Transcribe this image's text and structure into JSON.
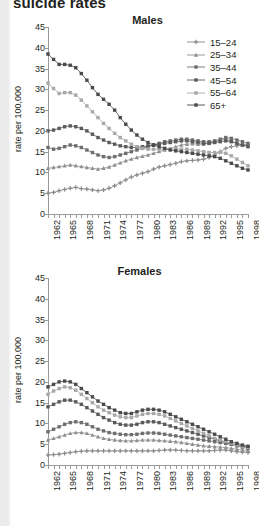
{
  "page": {
    "title": "suicide rates"
  },
  "axis": {
    "ylabel": "rate per 100,000",
    "yticks": [
      0,
      5,
      10,
      15,
      20,
      25,
      30,
      35,
      40,
      45
    ],
    "xlabels": [
      "1962",
      "1965",
      "1968",
      "1971",
      "1974",
      "1977",
      "1980",
      "1983",
      "1986",
      "1989",
      "1992",
      "1995",
      "1998"
    ]
  },
  "legend": {
    "items": [
      {
        "label": "15–24",
        "color": "#8a8a8a",
        "marker": "plus"
      },
      {
        "label": "25–34",
        "color": "#8f8f8f",
        "marker": "triangle"
      },
      {
        "label": "35–44",
        "color": "#6e6e6e",
        "marker": "square"
      },
      {
        "label": "45–54",
        "color": "#5a5a5a",
        "marker": "square"
      },
      {
        "label": "55–64",
        "color": "#a8a8a8",
        "marker": "square"
      },
      {
        "label": "65+",
        "color": "#4a4a4a",
        "marker": "square"
      }
    ]
  },
  "chart_data": [
    {
      "type": "line",
      "title": "Males",
      "xlabel": "",
      "ylabel": "rate per 100,000",
      "ylim": [
        0,
        45
      ],
      "grid": false,
      "legend_position": "top-right",
      "x": [
        1962,
        1963,
        1964,
        1965,
        1966,
        1967,
        1968,
        1969,
        1970,
        1971,
        1972,
        1973,
        1974,
        1975,
        1976,
        1977,
        1978,
        1979,
        1980,
        1981,
        1982,
        1983,
        1984,
        1985,
        1986,
        1987,
        1988,
        1989,
        1990,
        1991,
        1992,
        1993,
        1994,
        1995,
        1996,
        1997,
        1998
      ],
      "series": [
        {
          "name": "15–24",
          "color": "#8a8a8a",
          "values": [
            5.0,
            5.2,
            5.6,
            5.9,
            6.2,
            6.4,
            6.1,
            6.0,
            5.8,
            5.6,
            5.8,
            6.2,
            6.8,
            7.5,
            8.2,
            8.9,
            9.4,
            9.8,
            10.2,
            10.8,
            11.3,
            11.6,
            11.9,
            12.2,
            12.6,
            12.8,
            12.9,
            13.0,
            13.2,
            13.6,
            14.2,
            15.0,
            15.8,
            16.2,
            16.4,
            16.6,
            16.8
          ]
        },
        {
          "name": "25–34",
          "color": "#8f8f8f",
          "values": [
            11.0,
            11.2,
            11.4,
            11.6,
            11.8,
            11.6,
            11.4,
            11.2,
            11.0,
            10.8,
            11.0,
            11.3,
            11.8,
            12.3,
            12.8,
            13.2,
            13.6,
            13.9,
            14.2,
            14.6,
            15.0,
            15.4,
            15.8,
            16.2,
            16.6,
            16.8,
            16.9,
            16.8,
            16.8,
            17.0,
            17.4,
            17.8,
            18.0,
            17.6,
            17.0,
            16.6,
            16.4
          ]
        },
        {
          "name": "35–44",
          "color": "#6e6e6e",
          "values": [
            16.0,
            15.6,
            15.8,
            16.2,
            16.6,
            16.4,
            16.0,
            15.4,
            14.8,
            14.2,
            13.8,
            13.6,
            13.8,
            14.2,
            14.6,
            15.0,
            15.4,
            15.8,
            16.2,
            16.6,
            17.0,
            17.4,
            17.6,
            17.8,
            18.0,
            18.0,
            17.8,
            17.6,
            17.4,
            17.4,
            17.6,
            18.0,
            18.4,
            18.2,
            17.8,
            17.4,
            17.0
          ]
        },
        {
          "name": "45–54",
          "color": "#5a5a5a",
          "values": [
            20.0,
            20.2,
            20.6,
            21.0,
            21.2,
            21.0,
            20.6,
            20.0,
            19.2,
            18.4,
            17.8,
            17.2,
            16.8,
            16.4,
            16.2,
            16.0,
            16.0,
            16.2,
            16.4,
            16.6,
            16.8,
            17.0,
            17.2,
            17.4,
            17.6,
            17.6,
            17.4,
            17.2,
            17.0,
            17.0,
            17.2,
            17.4,
            17.6,
            17.4,
            17.0,
            16.6,
            16.2
          ]
        },
        {
          "name": "55–64",
          "color": "#a8a8a8",
          "values": [
            31.5,
            30.2,
            29.0,
            29.2,
            29.2,
            28.6,
            27.4,
            26.0,
            24.6,
            23.2,
            21.8,
            20.6,
            19.4,
            18.4,
            17.6,
            16.8,
            16.2,
            15.8,
            15.6,
            15.6,
            15.6,
            15.6,
            15.6,
            15.6,
            15.6,
            15.6,
            15.4,
            15.2,
            15.0,
            14.8,
            14.8,
            14.8,
            14.6,
            14.0,
            13.2,
            12.4,
            11.6
          ]
        },
        {
          "name": "65+",
          "color": "#4a4a4a",
          "values": [
            38.5,
            37.2,
            36.0,
            36.0,
            35.8,
            35.2,
            33.8,
            32.2,
            30.4,
            28.8,
            27.6,
            26.4,
            25.0,
            23.2,
            21.6,
            20.2,
            19.0,
            18.0,
            17.2,
            16.6,
            16.2,
            15.8,
            15.4,
            15.2,
            15.0,
            14.8,
            14.6,
            14.4,
            14.2,
            14.0,
            13.8,
            13.4,
            12.8,
            12.2,
            11.6,
            11.0,
            10.6
          ]
        }
      ]
    },
    {
      "type": "line",
      "title": "Females",
      "xlabel": "",
      "ylabel": "rate per 100,000",
      "ylim": [
        0,
        45
      ],
      "grid": false,
      "legend_position": "none",
      "x": [
        1962,
        1963,
        1964,
        1965,
        1966,
        1967,
        1968,
        1969,
        1970,
        1971,
        1972,
        1973,
        1974,
        1975,
        1976,
        1977,
        1978,
        1979,
        1980,
        1981,
        1982,
        1983,
        1984,
        1985,
        1986,
        1987,
        1988,
        1989,
        1990,
        1991,
        1992,
        1993,
        1994,
        1995,
        1996,
        1997,
        1998
      ],
      "series": [
        {
          "name": "15–24",
          "color": "#8a8a8a",
          "values": [
            2.4,
            2.5,
            2.6,
            2.8,
            3.0,
            3.2,
            3.3,
            3.4,
            3.4,
            3.4,
            3.4,
            3.4,
            3.4,
            3.4,
            3.4,
            3.4,
            3.4,
            3.4,
            3.4,
            3.4,
            3.5,
            3.6,
            3.6,
            3.6,
            3.5,
            3.4,
            3.4,
            3.4,
            3.4,
            3.4,
            3.5,
            3.6,
            3.6,
            3.4,
            3.2,
            3.1,
            3.0
          ]
        },
        {
          "name": "25–34",
          "color": "#8f8f8f",
          "values": [
            6.0,
            6.4,
            6.8,
            7.2,
            7.6,
            7.8,
            7.8,
            7.6,
            7.2,
            6.8,
            6.4,
            6.2,
            6.0,
            5.9,
            5.8,
            5.8,
            5.9,
            6.0,
            6.0,
            6.0,
            5.9,
            5.8,
            5.7,
            5.6,
            5.4,
            5.2,
            5.0,
            4.8,
            4.6,
            4.5,
            4.4,
            4.3,
            4.2,
            4.0,
            3.8,
            3.6,
            3.5
          ]
        },
        {
          "name": "35–44",
          "color": "#6e6e6e",
          "values": [
            8.0,
            8.6,
            9.2,
            9.8,
            10.2,
            10.4,
            10.2,
            9.8,
            9.2,
            8.6,
            8.2,
            7.8,
            7.6,
            7.4,
            7.3,
            7.3,
            7.4,
            7.6,
            7.7,
            7.7,
            7.6,
            7.4,
            7.2,
            7.0,
            6.8,
            6.6,
            6.4,
            6.2,
            6.0,
            5.8,
            5.6,
            5.4,
            5.2,
            5.0,
            4.8,
            4.6,
            4.4
          ]
        },
        {
          "name": "45–54",
          "color": "#5a5a5a",
          "values": [
            14.0,
            14.6,
            15.2,
            15.6,
            15.6,
            15.2,
            14.6,
            13.8,
            13.0,
            12.2,
            11.4,
            10.8,
            10.2,
            9.8,
            9.6,
            9.6,
            9.8,
            10.2,
            10.4,
            10.4,
            10.2,
            9.8,
            9.4,
            9.0,
            8.6,
            8.2,
            7.8,
            7.4,
            7.0,
            6.6,
            6.2,
            5.8,
            5.4,
            5.0,
            4.6,
            4.3,
            4.0
          ]
        },
        {
          "name": "55–64",
          "color": "#a8a8a8",
          "values": [
            17.0,
            17.8,
            18.4,
            18.8,
            18.6,
            18.0,
            17.0,
            16.0,
            15.0,
            14.0,
            13.2,
            12.6,
            12.0,
            11.6,
            11.4,
            11.4,
            11.8,
            12.2,
            12.4,
            12.4,
            12.2,
            11.8,
            11.2,
            10.6,
            10.0,
            9.4,
            8.8,
            8.2,
            7.6,
            7.0,
            6.4,
            6.0,
            5.6,
            5.2,
            4.8,
            4.4,
            4.2
          ]
        },
        {
          "name": "65+",
          "color": "#4a4a4a",
          "values": [
            18.8,
            19.4,
            20.0,
            20.2,
            20.0,
            19.4,
            18.4,
            17.4,
            16.4,
            15.4,
            14.6,
            13.8,
            13.2,
            12.6,
            12.4,
            12.4,
            12.8,
            13.2,
            13.4,
            13.4,
            13.2,
            12.8,
            12.2,
            11.6,
            11.0,
            10.4,
            9.8,
            9.2,
            8.6,
            8.0,
            7.4,
            6.8,
            6.2,
            5.6,
            5.2,
            4.8,
            4.5
          ]
        }
      ]
    }
  ]
}
